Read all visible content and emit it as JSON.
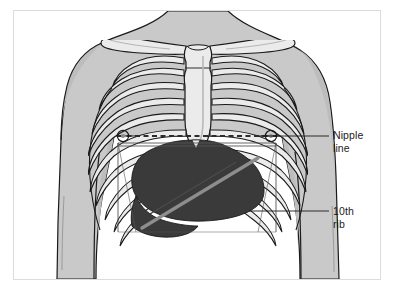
{
  "figure": {
    "type": "anatomical-illustration",
    "frame_border_color": "#dcdcdc",
    "background_color": "#ffffff"
  },
  "labels": [
    {
      "id": "nipple-line",
      "line1": "Nipple",
      "line2": "line",
      "leader_y": 136,
      "leader_x_start": 261,
      "leader_x_end": 329
    },
    {
      "id": "tenth-rib",
      "line1": "10th",
      "line2": "rib",
      "leader_y": 211,
      "leader_x_start": 249,
      "leader_x_end": 329
    }
  ],
  "colors": {
    "skin": "#c9c9c9",
    "skin_shadow": "#bdbdbd",
    "bone": "#ebebeb",
    "bone_shade": "#d2d2d2",
    "outline": "#1a1a1a",
    "liver_dark": "#3a3a3a",
    "liver_band": "#8d8d8d",
    "box_line": "#555555",
    "dash_line": "#2b2b2b",
    "label_text": "#1c1c1c",
    "frame": "#dcdcdc"
  },
  "annotations": {
    "nipple_line_style": "dashed horizontal line across chest at nipple level",
    "box_outline_style": "thin quadrilateral outlining upper abdominal region",
    "liver_style": "dark shaded organ below diaphragm with diagonal highlight band"
  }
}
